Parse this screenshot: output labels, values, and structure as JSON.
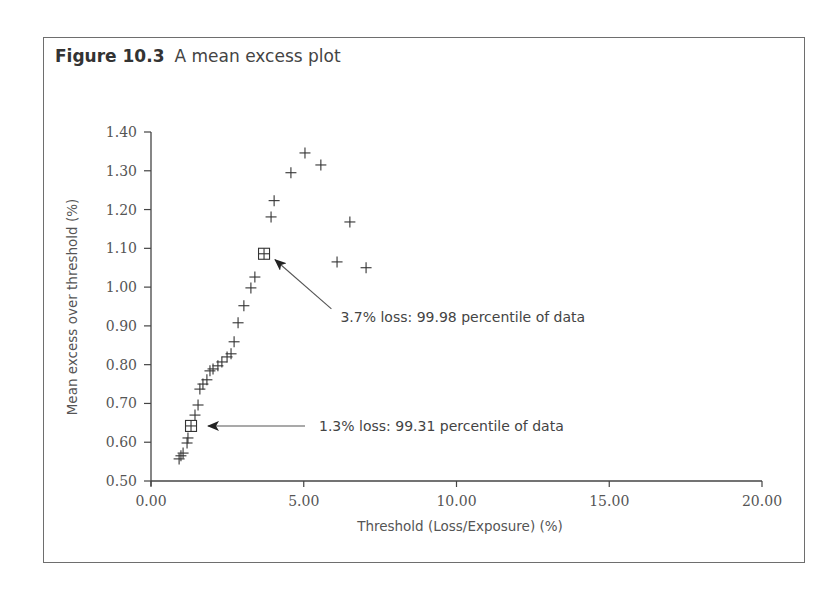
{
  "figure": {
    "number": "Figure 10.3",
    "title": "A mean excess plot"
  },
  "chart_data": {
    "type": "scatter",
    "title": "A mean excess plot",
    "xlabel": "Threshold (Loss/Exposure) (%)",
    "ylabel": "Mean excess over threshold (%)",
    "xlim": [
      0,
      20
    ],
    "ylim": [
      0.5,
      1.4
    ],
    "grid": false,
    "legend": null,
    "x_ticks": [
      "0.00",
      "5.00",
      "10.00",
      "15.00",
      "20.00"
    ],
    "y_ticks": [
      "0.50",
      "0.60",
      "0.70",
      "0.80",
      "0.90",
      "1.00",
      "1.10",
      "1.20",
      "1.30",
      "1.40"
    ],
    "series": [
      {
        "name": "Mean excess",
        "marker": "plus",
        "points": [
          [
            0.92,
            0.557
          ],
          [
            0.98,
            0.565
          ],
          [
            1.05,
            0.572
          ],
          [
            1.18,
            0.598
          ],
          [
            1.21,
            0.611
          ],
          [
            1.44,
            0.67
          ],
          [
            1.54,
            0.696
          ],
          [
            1.6,
            0.737
          ],
          [
            1.7,
            0.75
          ],
          [
            1.83,
            0.761
          ],
          [
            1.93,
            0.784
          ],
          [
            2.03,
            0.789
          ],
          [
            2.19,
            0.797
          ],
          [
            2.32,
            0.807
          ],
          [
            2.49,
            0.82
          ],
          [
            2.62,
            0.828
          ],
          [
            2.72,
            0.859
          ],
          [
            2.85,
            0.908
          ],
          [
            3.04,
            0.952
          ],
          [
            3.27,
            0.998
          ],
          [
            3.4,
            1.026
          ],
          [
            3.93,
            1.181
          ],
          [
            4.03,
            1.223
          ],
          [
            4.58,
            1.295
          ],
          [
            5.04,
            1.346
          ],
          [
            5.56,
            1.315
          ],
          [
            6.09,
            1.065
          ],
          [
            6.51,
            1.168
          ],
          [
            7.04,
            1.05
          ]
        ]
      },
      {
        "name": "Highlighted thresholds",
        "marker": "boxed-plus",
        "points": [
          [
            1.31,
            0.642
          ],
          [
            3.7,
            1.086
          ]
        ]
      }
    ],
    "annotations": [
      {
        "text": "1.3% loss:  99.31 percentile of data",
        "point": [
          1.31,
          0.642
        ],
        "text_position": [
          5.5,
          0.642
        ]
      },
      {
        "text": "3.7% loss:  99.98 percentile of data",
        "point": [
          3.7,
          1.086
        ],
        "text_position": [
          6.2,
          0.918
        ]
      }
    ]
  }
}
